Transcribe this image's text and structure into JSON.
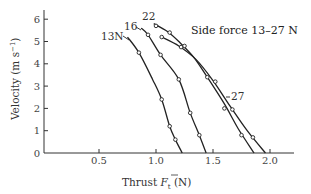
{
  "chart_data": {
    "type": "line",
    "title": "Side force 13–27 N",
    "xlabel": "Thrust F̄t (N)",
    "ylabel": "Velocity (m s⁻¹)",
    "xlim": [
      0,
      2.2
    ],
    "ylim": [
      0,
      6.4
    ],
    "xticks": [
      0.5,
      1.0,
      1.5,
      2.0
    ],
    "xtick_labels": [
      "0.5",
      "1.0",
      "1.5",
      "2.0"
    ],
    "yticks": [
      0,
      1,
      2,
      3,
      4,
      5,
      6
    ],
    "ytick_labels": [
      "0",
      "1",
      "2",
      "3",
      "4",
      "5",
      "6"
    ],
    "grid": false,
    "legend": "none (inline curve labels)",
    "series": [
      {
        "name": "13N",
        "label": "13N",
        "points": [
          [
            0.75,
            5.2
          ],
          [
            0.85,
            4.5
          ],
          [
            0.97,
            3.3
          ],
          [
            1.05,
            2.4
          ],
          [
            1.12,
            1.2
          ],
          [
            1.17,
            0.6
          ],
          [
            1.23,
            0.0
          ]
        ],
        "markers": [
          [
            0.85,
            4.5
          ],
          [
            1.05,
            2.4
          ],
          [
            1.12,
            1.2
          ],
          [
            1.17,
            0.6
          ]
        ]
      },
      {
        "name": "16",
        "label": "16",
        "points": [
          [
            0.87,
            5.6
          ],
          [
            0.93,
            5.3
          ],
          [
            1.04,
            4.4
          ],
          [
            1.2,
            3.3
          ],
          [
            1.3,
            1.8
          ],
          [
            1.38,
            0.8
          ],
          [
            1.44,
            0.0
          ]
        ],
        "markers": [
          [
            0.93,
            5.3
          ],
          [
            1.04,
            4.4
          ],
          [
            1.2,
            3.3
          ],
          [
            1.3,
            1.8
          ],
          [
            1.38,
            0.8
          ]
        ]
      },
      {
        "name": "22",
        "label": "22",
        "points": [
          [
            0.98,
            5.8
          ],
          [
            1.1,
            5.45
          ],
          [
            1.2,
            5.0
          ],
          [
            1.33,
            4.3
          ],
          [
            1.45,
            3.4
          ],
          [
            1.6,
            2.2
          ],
          [
            1.72,
            1.1
          ],
          [
            1.86,
            0.0
          ]
        ],
        "markers": [
          [
            1.0,
            5.7
          ],
          [
            1.12,
            5.4
          ],
          [
            1.25,
            4.8
          ],
          [
            1.45,
            3.4
          ],
          [
            1.6,
            2.0
          ],
          [
            1.75,
            0.8
          ]
        ]
      },
      {
        "name": "27",
        "label": "27",
        "points": [
          [
            1.05,
            5.2
          ],
          [
            1.2,
            4.8
          ],
          [
            1.35,
            4.2
          ],
          [
            1.5,
            3.25
          ],
          [
            1.65,
            2.1
          ],
          [
            1.8,
            1.0
          ],
          [
            1.96,
            0.0
          ]
        ],
        "markers": [
          [
            1.05,
            5.2
          ],
          [
            1.22,
            4.75
          ],
          [
            1.52,
            3.2
          ],
          [
            1.67,
            1.95
          ],
          [
            1.85,
            0.7
          ]
        ]
      }
    ]
  },
  "labels": {
    "title": "Side force 13–27 N",
    "xlabel_prefix": "Thrust ",
    "xlabel_symbol": "F",
    "xlabel_sub": "t",
    "xlabel_unit": " (N)",
    "ylabel": "Velocity (m s",
    "ylabel_sup": "−1",
    "ylabel_end": ")",
    "curve_13": "13N",
    "curve_16": "16",
    "curve_22": "22",
    "curve_27": "27"
  }
}
